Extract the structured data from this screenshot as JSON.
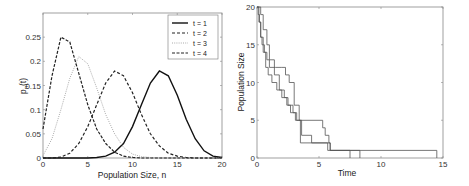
{
  "chart_data": [
    {
      "type": "line",
      "title": "",
      "xlabel": "Population Size, n",
      "ylabel": "p_n(t)",
      "xlim": [
        0,
        20
      ],
      "ylim": [
        0,
        0.3
      ],
      "xticks": [
        0,
        5,
        10,
        15,
        20
      ],
      "yticks": [
        0,
        0.05,
        0.1,
        0.15,
        0.2,
        0.25
      ],
      "ytick_labels": [
        "0",
        "0.05",
        "0.1",
        "0.15",
        "0.2",
        "0.25"
      ],
      "grid": false,
      "legend_position": "upper right",
      "x": [
        0,
        1,
        2,
        3,
        4,
        5,
        6,
        7,
        8,
        9,
        10,
        11,
        12,
        13,
        14,
        15,
        16,
        17,
        18,
        19,
        20
      ],
      "series": [
        {
          "name": "t = 1",
          "style": "solid",
          "color": "#111111",
          "values": [
            0,
            0,
            0,
            0,
            0,
            0,
            0.001,
            0.004,
            0.012,
            0.03,
            0.065,
            0.11,
            0.155,
            0.18,
            0.17,
            0.13,
            0.08,
            0.04,
            0.015,
            0.004,
            0.001
          ]
        },
        {
          "name": "t = 2",
          "style": "dashed",
          "color": "#222222",
          "values": [
            0,
            0,
            0.002,
            0.01,
            0.03,
            0.065,
            0.11,
            0.155,
            0.18,
            0.17,
            0.135,
            0.09,
            0.05,
            0.025,
            0.01,
            0.004,
            0.001,
            0,
            0,
            0,
            0
          ]
        },
        {
          "name": "t = 3",
          "style": "dotted",
          "color": "#aaaaaa",
          "values": [
            0.005,
            0.04,
            0.1,
            0.165,
            0.21,
            0.195,
            0.145,
            0.09,
            0.05,
            0.022,
            0.008,
            0.003,
            0.001,
            0,
            0,
            0,
            0,
            0,
            0,
            0,
            0
          ]
        },
        {
          "name": "t = 4",
          "style": "dashdot",
          "color": "#222222",
          "values": [
            0.06,
            0.17,
            0.25,
            0.24,
            0.175,
            0.11,
            0.06,
            0.03,
            0.012,
            0.004,
            0.001,
            0,
            0,
            0,
            0,
            0,
            0,
            0,
            0,
            0,
            0
          ]
        }
      ]
    },
    {
      "type": "line",
      "subtype": "step",
      "title": "",
      "xlabel": "Time",
      "ylabel": "Population Size",
      "xlim": [
        0,
        15
      ],
      "ylim": [
        0,
        20
      ],
      "xticks": [
        0,
        5,
        10,
        15
      ],
      "yticks": [
        0,
        5,
        10,
        15,
        20
      ],
      "grid": false,
      "series": [
        {
          "name": "run 1",
          "x": [
            0,
            0.1,
            0.2,
            0.3,
            0.4,
            0.6,
            0.8,
            1.0,
            1.5,
            2.0,
            2.3,
            2.6,
            3.0,
            3.4,
            5.3,
            5.5,
            5.8,
            5.9,
            14.5
          ],
          "values": [
            20,
            19,
            18,
            16,
            15,
            14,
            13,
            12,
            12,
            12,
            11,
            10,
            7,
            5,
            4,
            3,
            2,
            1,
            0
          ]
        },
        {
          "name": "run 2",
          "x": [
            0,
            0.15,
            0.3,
            0.5,
            0.7,
            0.9,
            1.2,
            1.6,
            2.0,
            2.4,
            2.7,
            3.1,
            3.6,
            4.4,
            5.7,
            7.5
          ],
          "values": [
            20,
            18,
            16,
            14,
            12,
            11,
            10,
            9,
            8,
            7,
            6,
            5,
            3,
            2,
            1,
            0
          ]
        },
        {
          "name": "run 3",
          "x": [
            0,
            0.3,
            0.5,
            0.8,
            1.0,
            1.4,
            1.8,
            2.2,
            2.5,
            2.9,
            3.2,
            3.5,
            5.9,
            8.3
          ],
          "values": [
            20,
            19,
            17,
            15,
            13,
            11,
            9,
            8,
            7,
            6,
            5,
            2,
            1,
            0
          ]
        }
      ]
    }
  ],
  "legend": {
    "items": [
      {
        "label": "t = 1"
      },
      {
        "label": "t = 2"
      },
      {
        "label": "t = 3"
      },
      {
        "label": "t = 4"
      }
    ]
  },
  "left_plot": {
    "xlabel": "Population Size, n",
    "ylabel_main": "p",
    "ylabel_sub": "n",
    "ylabel_arg": "(t)",
    "xtick_labels": [
      "0",
      "5",
      "10",
      "15",
      "20"
    ],
    "ytick_labels": [
      "0",
      "0.05",
      "0.1",
      "0.15",
      "0.2",
      "0.25"
    ]
  },
  "right_plot": {
    "xlabel": "Time",
    "ylabel": "Population Size",
    "xtick_labels": [
      "0",
      "5",
      "10",
      "15"
    ],
    "ytick_labels": [
      "0",
      "5",
      "10",
      "15",
      "20"
    ]
  }
}
